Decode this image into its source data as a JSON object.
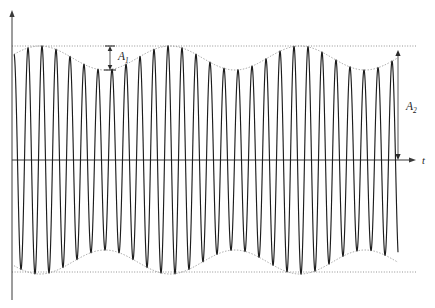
{
  "figure": {
    "background_color": "#ffffff",
    "width": 435,
    "height": 308
  },
  "axes": {
    "t_axis": {
      "label": "t",
      "name": "time-axis",
      "y": 160,
      "x_start": 12,
      "x_end": 416,
      "arrow": "right"
    },
    "y_axis": {
      "label": "",
      "name": "amplitude-axis",
      "x": 12,
      "y_top": 10,
      "y_bottom": 300,
      "arrow": "up"
    }
  },
  "annotations": [
    {
      "id": "a1",
      "label": "A",
      "subscript": "1",
      "name": "amplitude-a1-label",
      "description": "modulation minimum amplitude, double arrow between upper dotted reference line and envelope minimum",
      "x": 110,
      "y_top": 46,
      "y_bottom": 70,
      "label_x": 118,
      "label_y": 60
    },
    {
      "id": "a2",
      "label": "A",
      "subscript": "2",
      "name": "amplitude-a2-label",
      "description": "maximum amplitude, double arrow from time axis up to upper dotted reference line",
      "x": 398,
      "y_top": 50,
      "y_bottom": 160,
      "label_x": 406,
      "label_y": 110
    }
  ],
  "reference_lines": [
    {
      "name": "upper-reference-line",
      "y": 46,
      "x_start": 12,
      "x_end": 416,
      "style": "dotted"
    },
    {
      "name": "lower-reference-line",
      "y": 272,
      "x_start": 12,
      "x_end": 416,
      "style": "dotted"
    }
  ],
  "colors": {
    "carrier": "#1c1c1c",
    "envelope": "#8a8a8a",
    "reference": "#7a7a7a",
    "axis": "#3a3a3a",
    "label": "#1c1c1c",
    "background": "#ffffff"
  },
  "chart_data": {
    "type": "line",
    "title": "",
    "xlabel": "t",
    "ylabel": "",
    "grid": false,
    "legend": "none",
    "signal_model": {
      "formula": "y(t) = A_env(t) * sin(2*pi*f_c*t)",
      "envelope_formula": "A_env(t) = A_mean + A_delta * cos(2*pi*f_b*t)",
      "carrier_period_px": 14.0,
      "beat_period_px": 130.0,
      "carrier_cycles_per_beat": 9.29,
      "envelope_max_px": 114,
      "envelope_min_px": 90,
      "envelope_mean_px": 102,
      "envelope_delta_px": 12,
      "axis_y_px": 160,
      "x_start_px": 14,
      "x_end_px": 398,
      "envelope_peak_positions_px": [
        40,
        170,
        300
      ],
      "envelope_trough_positions_px": [
        105,
        235,
        365
      ],
      "samples_per_pixel": 8
    },
    "xlim": [
      14,
      398
    ],
    "ylim": [
      -114,
      114
    ],
    "series": [
      {
        "name": "carrier",
        "style": "solid",
        "color": "#1c1c1c"
      },
      {
        "name": "upper-envelope",
        "style": "dotted",
        "color": "#8a8a8a"
      },
      {
        "name": "lower-envelope",
        "style": "dotted",
        "color": "#8a8a8a"
      }
    ]
  }
}
